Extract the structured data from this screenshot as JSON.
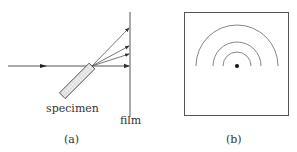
{
  "panel_a": {
    "specimen_label": "specimen",
    "film_label": "film",
    "caption": "(a)",
    "beam_y": 66,
    "film_x": 130,
    "ray_targets_y": [
      28,
      46,
      54,
      66
    ]
  },
  "panel_b": {
    "caption": "(b)",
    "center": [
      237,
      66
    ],
    "arc_radii": [
      14,
      24,
      41
    ]
  },
  "colors": {
    "stroke": "#555555",
    "dark": "#222222"
  }
}
